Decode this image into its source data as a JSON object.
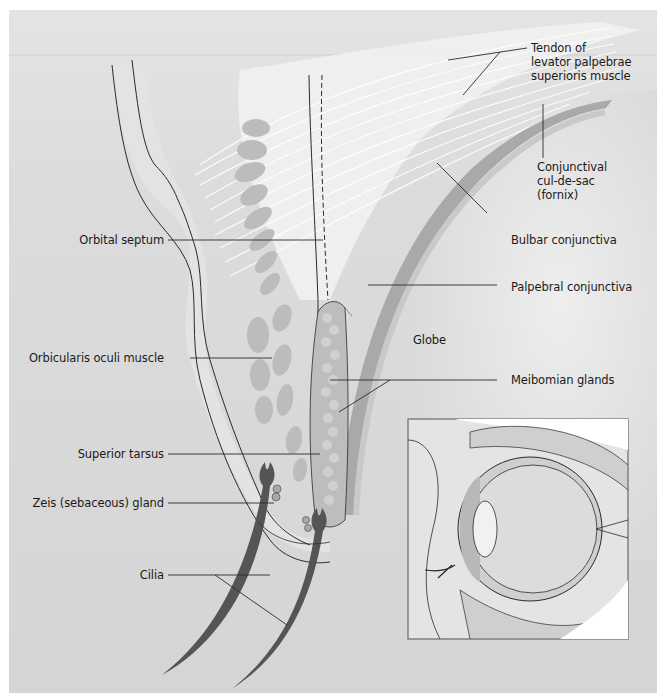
{
  "figure": {
    "colors": {
      "background": "#d6d6d6",
      "background_top": "#e6e6e6",
      "tissue_light": "#f1f1f1",
      "muscle": "#b9b9b9",
      "tarsus": "#bdbdbd",
      "gland_lobule": "#cfcfcf",
      "conjunctiva": "#a8a8a8",
      "cilia": "#555555",
      "outline": "#2a2a2a",
      "inset_frame": "#6a6a6a"
    }
  },
  "labels": {
    "tendon": [
      "Tendon of",
      "levator palpebrae",
      "superioris muscle"
    ],
    "fornix": [
      "Conjunctival",
      "cul-de-sac",
      "(fornix)"
    ],
    "bulbar": "Bulbar conjunctiva",
    "palpebral": "Palpebral conjunctiva",
    "globe": "Globe",
    "meibomian": "Meibomian glands",
    "orbital_septum": "Orbital septum",
    "orbicularis": "Orbicularis oculi muscle",
    "tarsus": "Superior tarsus",
    "zeis": "Zeis (sebaceous) gland",
    "cilia": "Cilia"
  },
  "inset": {
    "description": "Whole eye in orbit, sagittal view"
  }
}
